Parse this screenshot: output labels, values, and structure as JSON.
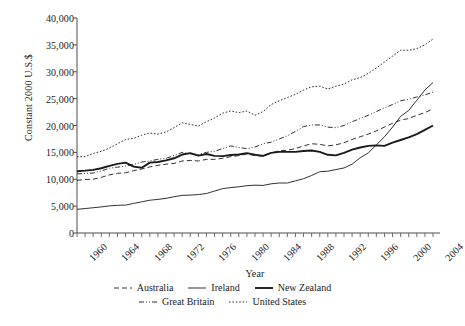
{
  "chart_data": {
    "type": "line",
    "title": "",
    "xlabel": "Year",
    "ylabel": "Constant 2000 U.S.$",
    "xlim": [
      1960,
      2004
    ],
    "ylim": [
      0,
      40000
    ],
    "ytick_values": [
      0,
      5000,
      10000,
      15000,
      20000,
      25000,
      30000,
      35000,
      40000
    ],
    "ytick_labels": [
      "0",
      "5,000",
      "10,000",
      "15,000",
      "20,000",
      "25,000",
      "30,000",
      "35,000",
      "40,000"
    ],
    "xtick_values": [
      1960,
      1964,
      1968,
      1972,
      1976,
      1980,
      1984,
      1988,
      1992,
      1996,
      2000,
      2004
    ],
    "xtick_labels": [
      "1960",
      "1964",
      "1968",
      "1972",
      "1976",
      "1980",
      "1984",
      "1988",
      "1992",
      "1996",
      "2000",
      "2004"
    ],
    "xminor_step": 1,
    "grid": false,
    "legend_position": "bottom",
    "x": [
      1960,
      1961,
      1962,
      1963,
      1964,
      1965,
      1966,
      1967,
      1968,
      1969,
      1970,
      1971,
      1972,
      1973,
      1974,
      1975,
      1976,
      1977,
      1978,
      1979,
      1980,
      1981,
      1982,
      1983,
      1984,
      1985,
      1986,
      1987,
      1988,
      1989,
      1990,
      1991,
      1992,
      1993,
      1994,
      1995,
      1996,
      1997,
      1998,
      1999,
      2000,
      2001,
      2002,
      2003,
      2004
    ],
    "series": [
      {
        "name": "Australia",
        "style": "dashed",
        "values": [
          9800,
          9950,
          10000,
          10350,
          10800,
          11100,
          11200,
          11600,
          11900,
          12300,
          12600,
          12800,
          12950,
          13400,
          13500,
          13400,
          13700,
          13700,
          13900,
          14200,
          14400,
          14700,
          14400,
          14300,
          14900,
          15300,
          15400,
          15700,
          16200,
          16600,
          16500,
          16200,
          16400,
          16800,
          17400,
          17900,
          18400,
          19000,
          19700,
          20400,
          21000,
          21300,
          21900,
          22400,
          23100
        ]
      },
      {
        "name": "Ireland",
        "style": "solid-thin",
        "values": [
          4400,
          4550,
          4700,
          4850,
          5050,
          5150,
          5200,
          5500,
          5800,
          6100,
          6250,
          6450,
          6750,
          7000,
          7050,
          7150,
          7350,
          7800,
          8250,
          8450,
          8600,
          8800,
          8900,
          8850,
          9150,
          9300,
          9300,
          9700,
          10100,
          10700,
          11400,
          11500,
          11800,
          12100,
          12800,
          14000,
          14900,
          16400,
          17900,
          19700,
          21700,
          22800,
          24700,
          26600,
          28000
        ]
      },
      {
        "name": "New Zealand",
        "style": "solid-thick",
        "values": [
          11500,
          11600,
          11750,
          12050,
          12500,
          12850,
          13100,
          12350,
          12150,
          13100,
          13200,
          13500,
          13900,
          14600,
          14850,
          14400,
          14700,
          14350,
          14300,
          14500,
          14600,
          14850,
          14550,
          14350,
          14900,
          15100,
          15100,
          15100,
          15250,
          15350,
          15100,
          14550,
          14450,
          14900,
          15500,
          15900,
          16200,
          16300,
          16200,
          16800,
          17300,
          17800,
          18400,
          19200,
          20000
        ]
      },
      {
        "name": "Great Britain",
        "style": "dash-dot",
        "values": [
          11000,
          11100,
          11150,
          11550,
          12050,
          12250,
          12450,
          12750,
          13200,
          13400,
          13700,
          13900,
          14400,
          15000,
          14700,
          14600,
          15000,
          15200,
          15700,
          16200,
          15900,
          15700,
          16000,
          16600,
          16900,
          17500,
          18100,
          18900,
          19800,
          20100,
          20100,
          19700,
          19600,
          20000,
          20700,
          21300,
          21900,
          22600,
          23300,
          23900,
          24600,
          24900,
          25300,
          25700,
          26200
        ]
      },
      {
        "name": "United States",
        "style": "dotted",
        "values": [
          14200,
          14200,
          14800,
          15200,
          15800,
          16600,
          17400,
          17600,
          18200,
          18600,
          18400,
          18800,
          19600,
          20500,
          20200,
          19900,
          20700,
          21400,
          22300,
          22700,
          22400,
          22700,
          21900,
          22600,
          23900,
          24600,
          25200,
          25800,
          26600,
          27200,
          27300,
          26800,
          27300,
          27700,
          28500,
          28900,
          29700,
          30700,
          31800,
          32900,
          34000,
          34000,
          34300,
          35000,
          36100
        ]
      }
    ]
  },
  "legend": {
    "row1": [
      "Australia",
      "Ireland",
      "New Zealand"
    ],
    "row2": [
      "Great Britain",
      "United States"
    ]
  }
}
